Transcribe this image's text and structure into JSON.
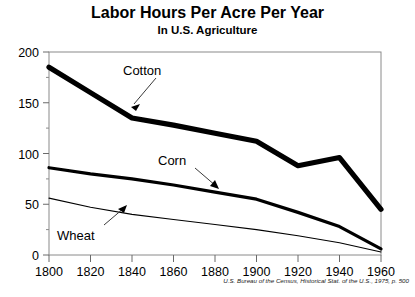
{
  "chart_data": {
    "type": "line",
    "title": "Labor Hours Per Acre Per Year",
    "subtitle": "In U.S. Agriculture",
    "xlabel": "",
    "ylabel": "",
    "xlim": [
      1800,
      1960
    ],
    "ylim": [
      0,
      200
    ],
    "grid": false,
    "legend_position": "inline-annotations",
    "x": [
      1800,
      1820,
      1840,
      1860,
      1880,
      1900,
      1920,
      1940,
      1960
    ],
    "xticks": [
      "1800",
      "1820",
      "1840",
      "1860",
      "1880",
      "1900",
      "1920",
      "1940",
      "1960"
    ],
    "yticks": [
      "0",
      "50",
      "100",
      "150",
      "200"
    ],
    "yticks_minor": [
      25,
      75,
      125,
      175
    ],
    "series": [
      {
        "name": "Cotton",
        "line_weight": "thick",
        "color": "#000000",
        "values": [
          185,
          160,
          135,
          128,
          120,
          112,
          88,
          96,
          45
        ]
      },
      {
        "name": "Corn",
        "line_weight": "medium",
        "color": "#000000",
        "values": [
          86,
          80,
          75,
          69,
          62,
          55,
          42,
          28,
          6
        ]
      },
      {
        "name": "Wheat",
        "line_weight": "thin",
        "color": "#000000",
        "values": [
          56,
          47,
          40,
          35,
          30,
          25,
          19,
          12,
          3
        ]
      }
    ],
    "annotations": [
      {
        "text": "Cotton",
        "target_x": 1840,
        "target_y": 135
      },
      {
        "text": "Corn",
        "target_x": 1880,
        "target_y": 62
      },
      {
        "text": "Wheat",
        "target_x": 1852,
        "target_y": 37
      }
    ],
    "source": "U.S. Bureau of the Census, Historical Stat. of the U.S., 1975, p. 500"
  }
}
